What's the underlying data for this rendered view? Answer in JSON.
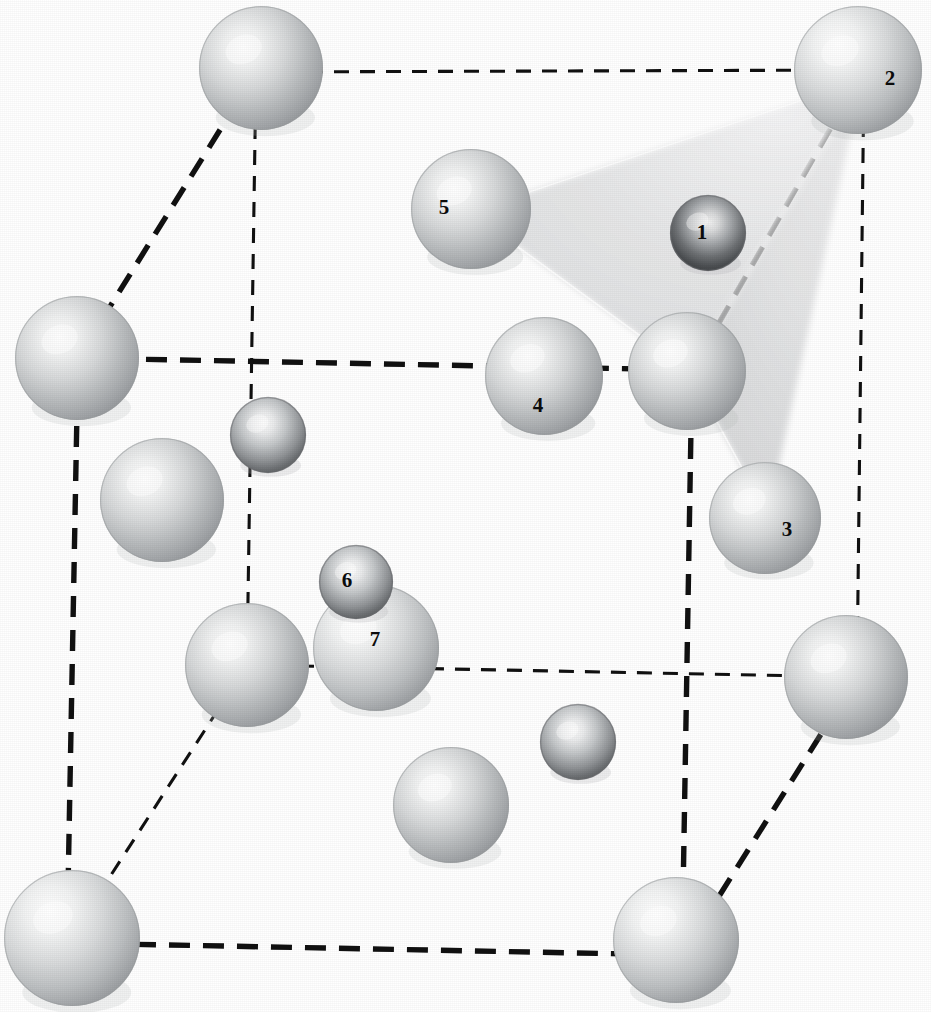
{
  "figure": {
    "kind": "crystal-structure-unit-cell",
    "background_color": "#ffffff",
    "width": 931,
    "height": 1012,
    "edge_color": "#111111",
    "host_atom_color": "#b9bbbd",
    "interstitial_atom_color": "#8d9093",
    "tetrahedron_fill": "#e6e7e8"
  },
  "atom_labels": [
    {
      "text": "1",
      "x": 702,
      "y": 232
    },
    {
      "text": "2",
      "x": 890,
      "y": 78
    },
    {
      "text": "3",
      "x": 787,
      "y": 529
    },
    {
      "text": "4",
      "x": 538,
      "y": 405
    },
    {
      "text": "5",
      "x": 444,
      "y": 207
    },
    {
      "text": "6",
      "x": 347,
      "y": 580
    },
    {
      "text": "7",
      "x": 375,
      "y": 639
    }
  ],
  "unit_cell": {
    "vertices": {
      "back_top_left": {
        "x": 256,
        "y": 72
      },
      "back_top_right": {
        "x": 864,
        "y": 70
      },
      "front_top_left": {
        "x": 78,
        "y": 358
      },
      "front_top_right": {
        "x": 692,
        "y": 370
      },
      "back_bottom_left": {
        "x": 247,
        "y": 665
      },
      "back_bottom_right": {
        "x": 857,
        "y": 677
      },
      "front_bottom_left": {
        "x": 67,
        "y": 943
      },
      "front_bottom_right": {
        "x": 682,
        "y": 955
      }
    },
    "edges": [
      {
        "name": "top-back",
        "from": "back_top_left",
        "to": "back_top_right",
        "weight": "thin"
      },
      {
        "name": "top-left-diag",
        "from": "back_top_left",
        "to": "front_top_left",
        "weight": "thick"
      },
      {
        "name": "top-right-diag",
        "from": "back_top_right",
        "to": "front_top_right",
        "weight": "thick"
      },
      {
        "name": "top-front",
        "from": "front_top_left",
        "to": "front_top_right",
        "weight": "thick"
      },
      {
        "name": "vert-back-left",
        "from": "back_top_left",
        "to": "back_bottom_left",
        "weight": "thin"
      },
      {
        "name": "vert-back-right",
        "from": "back_top_right",
        "to": "back_bottom_right",
        "weight": "thin"
      },
      {
        "name": "vert-front-left",
        "from": "front_top_left",
        "to": "front_bottom_left",
        "weight": "thick"
      },
      {
        "name": "vert-front-right",
        "from": "front_top_right",
        "to": "front_bottom_right",
        "weight": "thick"
      },
      {
        "name": "bot-back",
        "from": "back_bottom_left",
        "to": "back_bottom_right",
        "weight": "thin"
      },
      {
        "name": "bot-left-diag",
        "from": "back_bottom_left",
        "to": "front_bottom_left",
        "weight": "thin"
      },
      {
        "name": "bot-right-diag",
        "from": "back_bottom_right",
        "to": "front_bottom_right",
        "weight": "thick"
      },
      {
        "name": "bot-front",
        "from": "front_bottom_left",
        "to": "front_bottom_right",
        "weight": "thick"
      }
    ]
  },
  "tetrahedron": {
    "label": "interstitial-site-tetrahedron",
    "apex": {
      "x": 862,
      "y": 80
    },
    "base": [
      {
        "x": 470,
        "y": 212
      },
      {
        "x": 690,
        "y": 372
      },
      {
        "x": 768,
        "y": 516
      }
    ]
  },
  "atoms": [
    {
      "id": "corner-back-top-left",
      "type": "host",
      "x": 261,
      "y": 68,
      "r": 62
    },
    {
      "id": "corner-back-top-right",
      "type": "host",
      "x": 858,
      "y": 70,
      "r": 64,
      "label": "2"
    },
    {
      "id": "corner-front-top-left",
      "type": "host",
      "x": 77,
      "y": 358,
      "r": 62
    },
    {
      "id": "corner-front-top-right",
      "type": "host",
      "x": 687,
      "y": 371,
      "r": 59
    },
    {
      "id": "corner-back-bottom-left",
      "type": "host",
      "x": 247,
      "y": 665,
      "r": 62
    },
    {
      "id": "corner-back-bottom-right",
      "type": "host",
      "x": 846,
      "y": 677,
      "r": 62
    },
    {
      "id": "corner-front-bottom-left",
      "type": "host",
      "x": 72,
      "y": 938,
      "r": 68
    },
    {
      "id": "corner-front-bottom-right",
      "type": "host",
      "x": 676,
      "y": 940,
      "r": 63
    },
    {
      "id": "face-upper-right",
      "type": "host",
      "x": 471,
      "y": 209,
      "r": 60,
      "label": "5"
    },
    {
      "id": "face-mid-right",
      "type": "host",
      "x": 544,
      "y": 376,
      "r": 59,
      "label": "4"
    },
    {
      "id": "face-right-lower",
      "type": "host",
      "x": 765,
      "y": 518,
      "r": 56,
      "label": "3"
    },
    {
      "id": "face-left-upper",
      "type": "host",
      "x": 162,
      "y": 500,
      "r": 62
    },
    {
      "id": "face-left-lower",
      "type": "host",
      "x": 376,
      "y": 648,
      "r": 63,
      "label": "7"
    },
    {
      "id": "face-bottom-center",
      "type": "host",
      "x": 451,
      "y": 805,
      "r": 58
    },
    {
      "id": "interstitial-top",
      "type": "interstitial",
      "x": 708,
      "y": 233,
      "r": 38,
      "label": "1",
      "shade": "dark"
    },
    {
      "id": "interstitial-left",
      "type": "interstitial",
      "x": 268,
      "y": 435,
      "r": 38
    },
    {
      "id": "interstitial-small-mid",
      "type": "interstitial",
      "x": 356,
      "y": 582,
      "r": 37,
      "label": "6"
    },
    {
      "id": "interstitial-bottom",
      "type": "interstitial",
      "x": 578,
      "y": 742,
      "r": 38
    }
  ]
}
